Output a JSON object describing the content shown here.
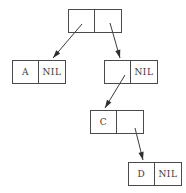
{
  "diagram": {
    "type": "cons-cell-tree",
    "canvas": {
      "width": 186,
      "height": 193
    },
    "style": {
      "line_color": "#3c3c3c",
      "box_border_color": "#4a4a4a",
      "text_color": "#3a3a3a",
      "background": "#ffffff"
    },
    "nodes": [
      {
        "id": "root",
        "name": "root-node",
        "left_cell": "",
        "right_cell": "",
        "x": 68,
        "y": 9,
        "width": 54,
        "height": 24
      },
      {
        "id": "node-a",
        "name": "node-a",
        "left_cell": "A",
        "right_cell": "NIL",
        "x": 12,
        "y": 60,
        "width": 54,
        "height": 24
      },
      {
        "id": "node-b",
        "name": "node-b",
        "left_cell": "",
        "right_cell": "NIL",
        "x": 104,
        "y": 60,
        "width": 54,
        "height": 24
      },
      {
        "id": "node-c",
        "name": "node-c",
        "left_cell": "C",
        "right_cell": "",
        "x": 90,
        "y": 110,
        "width": 54,
        "height": 24
      },
      {
        "id": "node-d",
        "name": "node-d",
        "left_cell": "D",
        "right_cell": "NIL",
        "x": 128,
        "y": 162,
        "width": 54,
        "height": 24
      }
    ],
    "edges": [
      {
        "id": "edge-root-left-to-a",
        "name": "pointer-root-left-to-node-a",
        "from": "root",
        "to": "node-a",
        "x1": 82,
        "y1": 24,
        "x2": 53,
        "y2": 58
      },
      {
        "id": "edge-root-right-to-b",
        "name": "pointer-root-right-to-node-b",
        "from": "root",
        "to": "node-b",
        "x1": 110,
        "y1": 23,
        "x2": 120,
        "y2": 58
      },
      {
        "id": "edge-b-left-to-c",
        "name": "pointer-node-b-left-to-node-c",
        "from": "node-b",
        "to": "node-c",
        "x1": 125,
        "y1": 75,
        "x2": 105,
        "y2": 108
      },
      {
        "id": "edge-c-right-to-d",
        "name": "pointer-node-c-right-to-node-d",
        "from": "node-c",
        "to": "node-d",
        "x1": 135,
        "y1": 128,
        "x2": 143,
        "y2": 160
      }
    ]
  }
}
